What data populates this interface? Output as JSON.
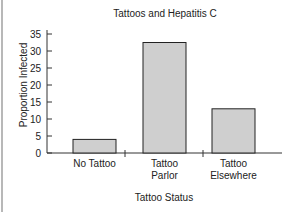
{
  "chart_data": {
    "type": "bar",
    "title": "Tattoos and Hepatitis C",
    "xlabel": "Tattoo Status",
    "ylabel": "Proportion Infected",
    "categories": [
      "No Tattoo",
      "Tattoo Parlor",
      "Tattoo Elsewhere"
    ],
    "category_lines": [
      [
        "No Tattoo"
      ],
      [
        "Tattoo",
        "Parlor"
      ],
      [
        "Tattoo",
        "Elsewhere"
      ]
    ],
    "values": [
      4,
      32.5,
      13
    ],
    "ylim": [
      0,
      35
    ],
    "yticks": [
      0,
      5,
      10,
      15,
      20,
      25,
      30,
      35
    ],
    "grid": false,
    "legend": null,
    "bar_color": "#cfcfcf",
    "bar_edge_color": "#222222"
  }
}
